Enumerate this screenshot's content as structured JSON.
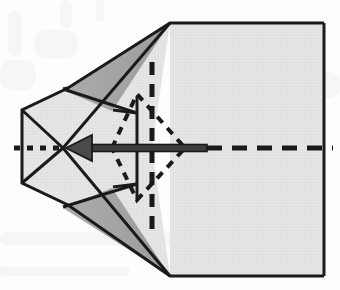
{
  "figure": {
    "type": "origami-instruction-diagram",
    "caption": "",
    "background_color": "#fdfdfd"
  },
  "palette": {
    "paper_light": "#e3e3e3",
    "paper_mid": "#d2d2d2",
    "paper_shadow": "#a8a8a8",
    "outline": "#1a1a1a",
    "fold_line": "#1a1a1a",
    "arrow": "#3d3d3d",
    "background": "#fdfdfd"
  },
  "canvas": {
    "width": 340,
    "height": 290
  },
  "shapes": {
    "body_rect": {
      "name": "main-paper-body",
      "points": "170,23 324,23 324,276 170,276",
      "fill": "paper_light"
    },
    "upper_flap": {
      "name": "upper-folded-flap",
      "points": "170,23 68,88 22,110 22,148 152,148",
      "fill": "paper_light"
    },
    "lower_flap": {
      "name": "lower-folded-flap",
      "points": "170,276 68,205 22,183 22,148 152,148",
      "fill": "paper_light"
    },
    "upper_shadow": {
      "name": "upper-shadow-triangle",
      "points": "170,23 112,111 63,90",
      "fill": "paper_shadow"
    },
    "lower_shadow": {
      "name": "lower-shadow-triangle",
      "points": "170,276 112,188 63,208",
      "fill": "paper_shadow"
    },
    "upper_mid_panel": {
      "name": "upper-middle-panel",
      "points": "22,110 68,88 135,112 112,148",
      "fill": "paper_light"
    },
    "lower_mid_panel": {
      "name": "lower-middle-panel",
      "points": "22,183 68,205 135,185 112,148",
      "fill": "paper_light"
    },
    "upper_inner_wedge": {
      "name": "upper-inner-wedge",
      "points": "112,148 135,112 170,23 152,148",
      "fill": "paper_light"
    },
    "lower_inner_wedge": {
      "name": "lower-inner-wedge",
      "points": "112,148 135,185 170,276 152,148",
      "fill": "paper_light"
    }
  },
  "lines": {
    "diamond": {
      "name": "dashed-fold-diamond",
      "points": "112,148 137,94 185,148 137,200",
      "style": "dotted"
    },
    "vertical_solid": {
      "name": "vertical-solid-fold-line",
      "x": 137,
      "y1": 96,
      "y2": 201
    },
    "vertical_dashed": {
      "name": "vertical-dashed-fold-line",
      "x": 152,
      "y1": 62,
      "y2": 236
    },
    "center_axis_left": {
      "name": "center-axis-dotted-left",
      "x1": 14,
      "x2": 63,
      "y": 148
    },
    "center_axis_right": {
      "name": "center-axis-dashed-right",
      "x1": 207,
      "x2": 333,
      "y": 148
    }
  },
  "arrow": {
    "name": "fold-direction-arrow",
    "label": "",
    "direction": "left",
    "tail_x": 207,
    "tip_x": 66,
    "y": 148,
    "shaft_thickness": 7,
    "head_width": 22,
    "head_height": 26
  },
  "annotations": []
}
